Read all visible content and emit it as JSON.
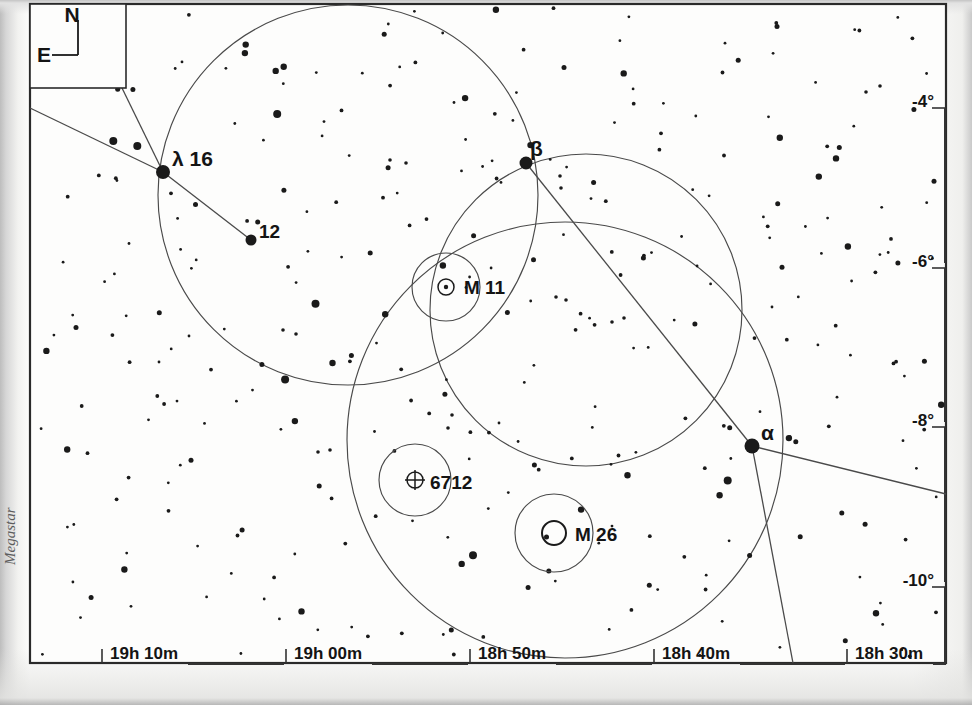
{
  "chart_meta": {
    "watermark": "Megastar",
    "compass": {
      "north_label": "N",
      "east_label": "E"
    },
    "frame": {
      "left": 30,
      "top": 4,
      "right": 946,
      "bottom": 663
    },
    "colors": {
      "ink": "#1a1a1a",
      "line": "#4a4a4a",
      "paper": "#fdfdfc",
      "border": "#2a2a2a"
    }
  },
  "chart_data": {
    "type": "scatter",
    "title": "",
    "xlabel": "",
    "ylabel": "",
    "grid": false,
    "legend_position": "none",
    "xlim": [
      "19h 15m",
      "18h 27m"
    ],
    "ylim": [
      -11.0,
      -3.2
    ],
    "xticks": [
      {
        "label": "19h 10m",
        "x": 110
      },
      {
        "label": "19h 00m",
        "x": 294
      },
      {
        "label": "18h 50m",
        "x": 478
      },
      {
        "label": "18h 40m",
        "x": 662
      },
      {
        "label": "18h 30m",
        "x": 855
      }
    ],
    "yticks": [
      {
        "label": "-4°",
        "y": 101
      },
      {
        "label": "-6°",
        "y": 261
      },
      {
        "label": "-8°",
        "y": 420
      },
      {
        "label": "-10°",
        "y": 580
      }
    ],
    "labeled_stars": [
      {
        "name": "λ",
        "label": "λ  16",
        "x": 163,
        "y": 172,
        "r": 7.0
      },
      {
        "name": "12",
        "label": "12",
        "x": 251,
        "y": 240,
        "r": 5.5
      },
      {
        "name": "β",
        "label": "β",
        "x": 526,
        "y": 163,
        "r": 6.5
      },
      {
        "name": "α",
        "label": "α",
        "x": 752,
        "y": 446,
        "r": 7.5
      }
    ],
    "deep_sky_objects": [
      {
        "label": "M 11",
        "symbol": "open-cluster",
        "x": 446,
        "y": 287,
        "r": 8,
        "halo_r": 34,
        "lx": 464,
        "ly": 294
      },
      {
        "label": "6712",
        "symbol": "globular-cluster",
        "x": 415,
        "y": 480,
        "r": 8,
        "halo_r": 36,
        "lx": 430,
        "ly": 489
      },
      {
        "label": "M 26",
        "symbol": "open-cluster-ring",
        "x": 554,
        "y": 533,
        "r": 12,
        "halo_r": 39,
        "lx": 575,
        "ly": 541
      }
    ],
    "constellation_circles": [
      {
        "name": "scutum-boundary-upper-left",
        "cx": 348,
        "cy": 195,
        "r": 190
      },
      {
        "name": "scutum-boundary-upper-right",
        "cx": 586,
        "cy": 310,
        "r": 156
      },
      {
        "name": "scutum-boundary-lower",
        "cx": 565,
        "cy": 440,
        "r": 218
      }
    ],
    "constellation_lines": [
      {
        "name": "lambda-to-left-edge",
        "x1": 163,
        "y1": 172,
        "x2": 30,
        "y2": 108
      },
      {
        "name": "lambda-to-compass-corner",
        "x1": 163,
        "y1": 172,
        "x2": 122,
        "y2": 88
      },
      {
        "name": "lambda-to-12",
        "x1": 163,
        "y1": 172,
        "x2": 251,
        "y2": 240
      },
      {
        "name": "beta-to-alpha",
        "x1": 526,
        "y1": 163,
        "x2": 752,
        "y2": 446
      },
      {
        "name": "alpha-to-right-edge",
        "x1": 752,
        "y1": 446,
        "x2": 946,
        "y2": 494
      },
      {
        "name": "alpha-to-bottom-edge",
        "x1": 752,
        "y1": 446,
        "x2": 793,
        "y2": 663
      }
    ],
    "star_counts": {
      "total": 318,
      "magnitude_classes": 5
    }
  }
}
